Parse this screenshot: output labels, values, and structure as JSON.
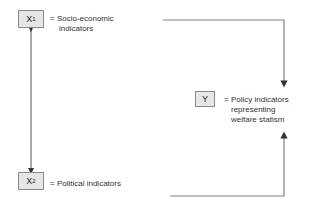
{
  "nodes": {
    "x1": {
      "symbol": "X",
      "subscript": "1",
      "description_line1": "= Socio-economic",
      "description_line2": "indicators"
    },
    "x2": {
      "symbol": "X",
      "subscript": "2",
      "description": "= Political indicators"
    },
    "y": {
      "symbol": "Y",
      "description_line1": "= Policy indicators",
      "description_line2": "representing",
      "description_line3": "welfare statism"
    }
  },
  "edges": [
    {
      "from": "x1",
      "to": "x2",
      "type": "bidirectional"
    },
    {
      "from": "x1",
      "to": "y",
      "type": "directed"
    },
    {
      "from": "x2",
      "to": "y",
      "type": "directed"
    }
  ],
  "colors": {
    "line": "#808080",
    "box_fill": "#e6e6e6",
    "box_border": "#8a8a8a"
  }
}
